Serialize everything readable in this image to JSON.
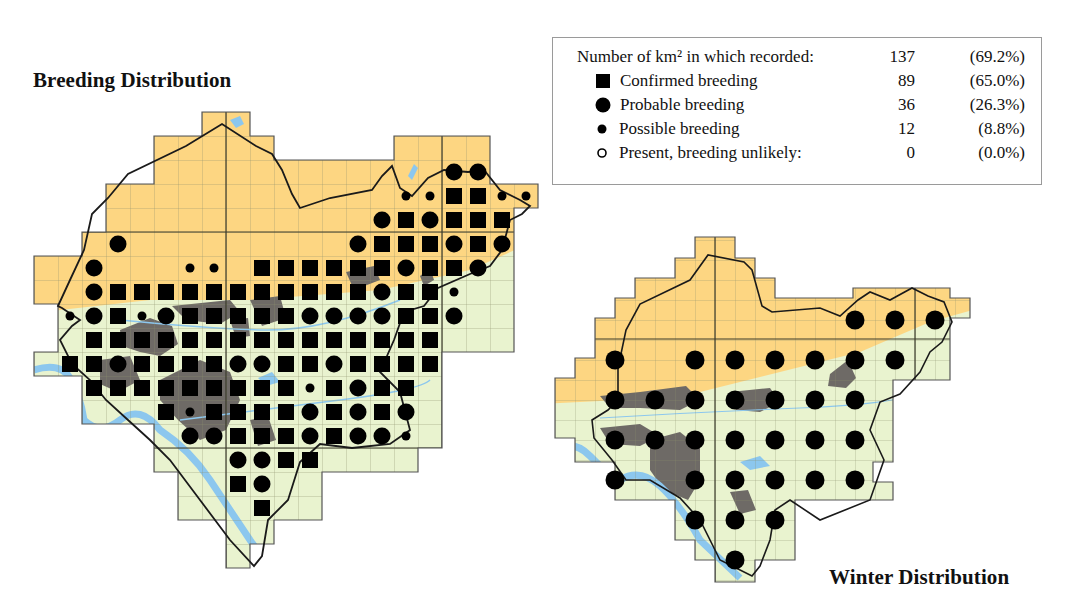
{
  "titles": {
    "breeding": "Breeding Distribution",
    "winter": "Winter Distribution"
  },
  "legend": {
    "header": {
      "label": "Number of km² in which recorded:",
      "count": "137",
      "percent": "(69.2%)"
    },
    "rows": [
      {
        "symbol": "square-filled",
        "label": "Confirmed breeding",
        "count": "89",
        "percent": "(65.0%)"
      },
      {
        "symbol": "circle-large",
        "label": "Probable breeding",
        "count": "36",
        "percent": "(26.3%)"
      },
      {
        "symbol": "circle-small",
        "label": "Possible breeding",
        "count": "12",
        "percent": "(8.8%)"
      },
      {
        "symbol": "circle-open",
        "label": "Present, breeding unlikely:",
        "count": "0",
        "percent": "(0.0%)"
      }
    ]
  },
  "colors": {
    "upland": "#fdd682",
    "lowland": "#e9f3cf",
    "urban": "#6e6a66",
    "water": "#8cc7ee",
    "grid": "#8a8f6a",
    "marker": "#000000"
  },
  "breeding_map": {
    "grid": {
      "origin_x": 10,
      "origin_y": 112,
      "cell": 24
    },
    "markers": [
      {
        "r": 2,
        "c": 18,
        "t": "P"
      },
      {
        "r": 2,
        "c": 19,
        "t": "P"
      },
      {
        "r": 3,
        "c": 16,
        "t": "S"
      },
      {
        "r": 3,
        "c": 17,
        "t": "S"
      },
      {
        "r": 3,
        "c": 18,
        "t": "C"
      },
      {
        "r": 3,
        "c": 19,
        "t": "C"
      },
      {
        "r": 3,
        "c": 20,
        "t": "S"
      },
      {
        "r": 3,
        "c": 21,
        "t": "S"
      },
      {
        "r": 4,
        "c": 15,
        "t": "P"
      },
      {
        "r": 4,
        "c": 16,
        "t": "C"
      },
      {
        "r": 4,
        "c": 17,
        "t": "P"
      },
      {
        "r": 4,
        "c": 18,
        "t": "C"
      },
      {
        "r": 4,
        "c": 19,
        "t": "C"
      },
      {
        "r": 4,
        "c": 20,
        "t": "C"
      },
      {
        "r": 5,
        "c": 4,
        "t": "P"
      },
      {
        "r": 5,
        "c": 14,
        "t": "P"
      },
      {
        "r": 5,
        "c": 15,
        "t": "C"
      },
      {
        "r": 5,
        "c": 16,
        "t": "C"
      },
      {
        "r": 5,
        "c": 17,
        "t": "C"
      },
      {
        "r": 5,
        "c": 18,
        "t": "P"
      },
      {
        "r": 5,
        "c": 19,
        "t": "C"
      },
      {
        "r": 5,
        "c": 20,
        "t": "P"
      },
      {
        "r": 6,
        "c": 3,
        "t": "P"
      },
      {
        "r": 6,
        "c": 7,
        "t": "S"
      },
      {
        "r": 6,
        "c": 8,
        "t": "S"
      },
      {
        "r": 6,
        "c": 10,
        "t": "C"
      },
      {
        "r": 6,
        "c": 11,
        "t": "C"
      },
      {
        "r": 6,
        "c": 12,
        "t": "C"
      },
      {
        "r": 6,
        "c": 13,
        "t": "C"
      },
      {
        "r": 6,
        "c": 14,
        "t": "C"
      },
      {
        "r": 6,
        "c": 15,
        "t": "C"
      },
      {
        "r": 6,
        "c": 16,
        "t": "P"
      },
      {
        "r": 6,
        "c": 17,
        "t": "C"
      },
      {
        "r": 6,
        "c": 18,
        "t": "C"
      },
      {
        "r": 6,
        "c": 19,
        "t": "P"
      },
      {
        "r": 7,
        "c": 3,
        "t": "P"
      },
      {
        "r": 7,
        "c": 4,
        "t": "C"
      },
      {
        "r": 7,
        "c": 5,
        "t": "C"
      },
      {
        "r": 7,
        "c": 6,
        "t": "C"
      },
      {
        "r": 7,
        "c": 7,
        "t": "C"
      },
      {
        "r": 7,
        "c": 8,
        "t": "C"
      },
      {
        "r": 7,
        "c": 9,
        "t": "C"
      },
      {
        "r": 7,
        "c": 10,
        "t": "C"
      },
      {
        "r": 7,
        "c": 11,
        "t": "C"
      },
      {
        "r": 7,
        "c": 12,
        "t": "C"
      },
      {
        "r": 7,
        "c": 13,
        "t": "C"
      },
      {
        "r": 7,
        "c": 14,
        "t": "C"
      },
      {
        "r": 7,
        "c": 15,
        "t": "P"
      },
      {
        "r": 7,
        "c": 16,
        "t": "C"
      },
      {
        "r": 7,
        "c": 17,
        "t": "C"
      },
      {
        "r": 7,
        "c": 18,
        "t": "S"
      },
      {
        "r": 8,
        "c": 2,
        "t": "S"
      },
      {
        "r": 8,
        "c": 3,
        "t": "P"
      },
      {
        "r": 8,
        "c": 4,
        "t": "C"
      },
      {
        "r": 8,
        "c": 5,
        "t": "S"
      },
      {
        "r": 8,
        "c": 6,
        "t": "P"
      },
      {
        "r": 8,
        "c": 7,
        "t": "C"
      },
      {
        "r": 8,
        "c": 8,
        "t": "C"
      },
      {
        "r": 8,
        "c": 9,
        "t": "C"
      },
      {
        "r": 8,
        "c": 10,
        "t": "C"
      },
      {
        "r": 8,
        "c": 11,
        "t": "C"
      },
      {
        "r": 8,
        "c": 12,
        "t": "P"
      },
      {
        "r": 8,
        "c": 13,
        "t": "P"
      },
      {
        "r": 8,
        "c": 14,
        "t": "P"
      },
      {
        "r": 8,
        "c": 15,
        "t": "P"
      },
      {
        "r": 8,
        "c": 16,
        "t": "C"
      },
      {
        "r": 8,
        "c": 17,
        "t": "C"
      },
      {
        "r": 8,
        "c": 18,
        "t": "P"
      },
      {
        "r": 9,
        "c": 3,
        "t": "C"
      },
      {
        "r": 9,
        "c": 4,
        "t": "C"
      },
      {
        "r": 9,
        "c": 5,
        "t": "C"
      },
      {
        "r": 9,
        "c": 6,
        "t": "C"
      },
      {
        "r": 9,
        "c": 7,
        "t": "C"
      },
      {
        "r": 9,
        "c": 8,
        "t": "C"
      },
      {
        "r": 9,
        "c": 9,
        "t": "C"
      },
      {
        "r": 9,
        "c": 10,
        "t": "C"
      },
      {
        "r": 9,
        "c": 11,
        "t": "C"
      },
      {
        "r": 9,
        "c": 12,
        "t": "C"
      },
      {
        "r": 9,
        "c": 13,
        "t": "C"
      },
      {
        "r": 9,
        "c": 14,
        "t": "C"
      },
      {
        "r": 9,
        "c": 15,
        "t": "C"
      },
      {
        "r": 9,
        "c": 16,
        "t": "C"
      },
      {
        "r": 9,
        "c": 17,
        "t": "C"
      },
      {
        "r": 10,
        "c": 2,
        "t": "C"
      },
      {
        "r": 10,
        "c": 3,
        "t": "C"
      },
      {
        "r": 10,
        "c": 4,
        "t": "P"
      },
      {
        "r": 10,
        "c": 5,
        "t": "C"
      },
      {
        "r": 10,
        "c": 6,
        "t": "C"
      },
      {
        "r": 10,
        "c": 7,
        "t": "C"
      },
      {
        "r": 10,
        "c": 8,
        "t": "C"
      },
      {
        "r": 10,
        "c": 9,
        "t": "P"
      },
      {
        "r": 10,
        "c": 10,
        "t": "P"
      },
      {
        "r": 10,
        "c": 11,
        "t": "C"
      },
      {
        "r": 10,
        "c": 12,
        "t": "C"
      },
      {
        "r": 10,
        "c": 13,
        "t": "P"
      },
      {
        "r": 10,
        "c": 14,
        "t": "C"
      },
      {
        "r": 10,
        "c": 15,
        "t": "C"
      },
      {
        "r": 10,
        "c": 16,
        "t": "C"
      },
      {
        "r": 10,
        "c": 17,
        "t": "C"
      },
      {
        "r": 11,
        "c": 3,
        "t": "C"
      },
      {
        "r": 11,
        "c": 4,
        "t": "C"
      },
      {
        "r": 11,
        "c": 5,
        "t": "C"
      },
      {
        "r": 11,
        "c": 6,
        "t": "C"
      },
      {
        "r": 11,
        "c": 7,
        "t": "C"
      },
      {
        "r": 11,
        "c": 8,
        "t": "C"
      },
      {
        "r": 11,
        "c": 9,
        "t": "C"
      },
      {
        "r": 11,
        "c": 10,
        "t": "C"
      },
      {
        "r": 11,
        "c": 11,
        "t": "C"
      },
      {
        "r": 11,
        "c": 12,
        "t": "S"
      },
      {
        "r": 11,
        "c": 13,
        "t": "C"
      },
      {
        "r": 11,
        "c": 14,
        "t": "P"
      },
      {
        "r": 11,
        "c": 15,
        "t": "C"
      },
      {
        "r": 11,
        "c": 16,
        "t": "C"
      },
      {
        "r": 12,
        "c": 6,
        "t": "C"
      },
      {
        "r": 12,
        "c": 7,
        "t": "S"
      },
      {
        "r": 12,
        "c": 8,
        "t": "C"
      },
      {
        "r": 12,
        "c": 9,
        "t": "C"
      },
      {
        "r": 12,
        "c": 10,
        "t": "C"
      },
      {
        "r": 12,
        "c": 11,
        "t": "C"
      },
      {
        "r": 12,
        "c": 12,
        "t": "P"
      },
      {
        "r": 12,
        "c": 13,
        "t": "C"
      },
      {
        "r": 12,
        "c": 14,
        "t": "P"
      },
      {
        "r": 12,
        "c": 15,
        "t": "C"
      },
      {
        "r": 12,
        "c": 16,
        "t": "P"
      },
      {
        "r": 13,
        "c": 7,
        "t": "P"
      },
      {
        "r": 13,
        "c": 8,
        "t": "P"
      },
      {
        "r": 13,
        "c": 9,
        "t": "C"
      },
      {
        "r": 13,
        "c": 10,
        "t": "C"
      },
      {
        "r": 13,
        "c": 11,
        "t": "C"
      },
      {
        "r": 13,
        "c": 12,
        "t": "P"
      },
      {
        "r": 13,
        "c": 13,
        "t": "C"
      },
      {
        "r": 13,
        "c": 14,
        "t": "P"
      },
      {
        "r": 13,
        "c": 15,
        "t": "P"
      },
      {
        "r": 13,
        "c": 16,
        "t": "S"
      },
      {
        "r": 14,
        "c": 9,
        "t": "P"
      },
      {
        "r": 14,
        "c": 10,
        "t": "P"
      },
      {
        "r": 14,
        "c": 11,
        "t": "C"
      },
      {
        "r": 14,
        "c": 12,
        "t": "C"
      },
      {
        "r": 15,
        "c": 9,
        "t": "C"
      },
      {
        "r": 15,
        "c": 10,
        "t": "P"
      },
      {
        "r": 16,
        "c": 10,
        "t": "C"
      }
    ]
  },
  "winter_map": {
    "grid": {
      "origin_x": 595,
      "origin_y": 340,
      "cell": 40
    },
    "markers": [
      {
        "r": -1,
        "c": 6
      },
      {
        "r": -1,
        "c": 7
      },
      {
        "r": -1,
        "c": 8
      },
      {
        "r": 0,
        "c": 0
      },
      {
        "r": 0,
        "c": 2
      },
      {
        "r": 0,
        "c": 3
      },
      {
        "r": 0,
        "c": 4
      },
      {
        "r": 0,
        "c": 5
      },
      {
        "r": 0,
        "c": 6
      },
      {
        "r": 0,
        "c": 7
      },
      {
        "r": 1,
        "c": 0
      },
      {
        "r": 1,
        "c": 1
      },
      {
        "r": 1,
        "c": 2
      },
      {
        "r": 1,
        "c": 3
      },
      {
        "r": 1,
        "c": 4
      },
      {
        "r": 1,
        "c": 5
      },
      {
        "r": 1,
        "c": 6
      },
      {
        "r": 2,
        "c": 0
      },
      {
        "r": 2,
        "c": 1
      },
      {
        "r": 2,
        "c": 2
      },
      {
        "r": 2,
        "c": 3
      },
      {
        "r": 2,
        "c": 4
      },
      {
        "r": 2,
        "c": 5
      },
      {
        "r": 2,
        "c": 6
      },
      {
        "r": 3,
        "c": 0
      },
      {
        "r": 3,
        "c": 2
      },
      {
        "r": 3,
        "c": 3
      },
      {
        "r": 3,
        "c": 4
      },
      {
        "r": 3,
        "c": 5
      },
      {
        "r": 3,
        "c": 6
      },
      {
        "r": 4,
        "c": 2
      },
      {
        "r": 4,
        "c": 3
      },
      {
        "r": 4,
        "c": 4
      },
      {
        "r": 5,
        "c": 3
      }
    ]
  }
}
